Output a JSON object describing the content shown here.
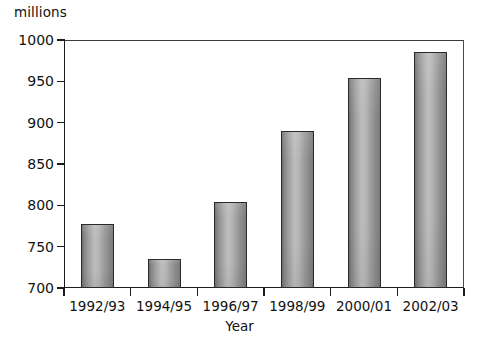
{
  "chart_data": {
    "type": "bar",
    "title": "",
    "subtitle": "",
    "unit_label": "millions",
    "xlabel": "Year",
    "ylabel": "",
    "categories": [
      "1992/93",
      "1994/95",
      "1996/97",
      "1998/99",
      "2000/01",
      "2002/03"
    ],
    "values": [
      778,
      735,
      804,
      890,
      954,
      986
    ],
    "ylim": [
      700,
      1000
    ],
    "ytick_labels": [
      "700",
      "750",
      "800",
      "850",
      "900",
      "950",
      "1000"
    ],
    "ytick_values": [
      700,
      750,
      800,
      850,
      900,
      950,
      1000
    ],
    "grid": true,
    "legend": "none",
    "bar_color": "#a8a8a8",
    "bar_border_color": "#2a2a2a",
    "axis_color": "#1b1b1b",
    "gridline_color": "#d8d8d8",
    "background_color": "#ffffff"
  }
}
